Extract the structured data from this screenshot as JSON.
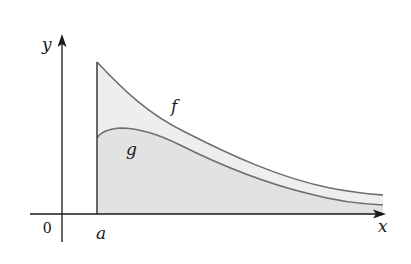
{
  "diagram": {
    "type": "area-between-curves",
    "axes": {
      "x_label": "x",
      "y_label": "y",
      "origin_label": "0"
    },
    "markers": {
      "a_label": "a"
    },
    "curves": [
      {
        "name": "f",
        "label": "f",
        "description": "decreasing curve starting at height at x=a, approaching x-axis"
      },
      {
        "name": "g",
        "label": "g",
        "description": "curve below f, rising slightly after a then decreasing toward x-axis"
      }
    ],
    "colors": {
      "axis": "#1a1a1a",
      "curve": "#6e6e6e",
      "fill_between": "#eeeeee",
      "fill_under_g": "#e2e2e2",
      "boundary_line": "#444444"
    }
  }
}
